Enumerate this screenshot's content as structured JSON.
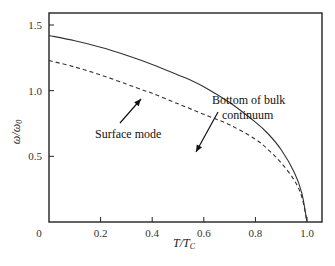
{
  "chart_data": {
    "type": "line",
    "title": "",
    "xlabel": "T/T_C",
    "xlabel_main": "T/T",
    "xlabel_sub": "C",
    "ylabel": "ω/ω_0",
    "ylabel_main": "ω/ω",
    "ylabel_sub": "0",
    "xlim": [
      0,
      1.06
    ],
    "ylim": [
      0,
      1.6
    ],
    "xticks": [
      0,
      0.2,
      0.4,
      0.6,
      0.8,
      1.0
    ],
    "xtick_labels": [
      "0",
      "0.2",
      "0.4",
      "0.6",
      "0.8",
      "1.0"
    ],
    "yticks": [
      0.5,
      1.0,
      1.5
    ],
    "ytick_labels": [
      "0.5",
      "1.0",
      "1.5"
    ],
    "grid": false,
    "legend": "none (inline annotations)",
    "series": [
      {
        "name": "Bottom of bulk continuum",
        "style": "solid",
        "x": [
          0,
          0.1,
          0.2,
          0.3,
          0.4,
          0.5,
          0.55,
          0.6,
          0.7,
          0.8,
          0.85,
          0.9,
          0.95,
          0.98,
          1.0
        ],
        "y": [
          1.42,
          1.38,
          1.33,
          1.27,
          1.2,
          1.12,
          1.08,
          1.03,
          0.91,
          0.76,
          0.67,
          0.55,
          0.38,
          0.22,
          0.0
        ]
      },
      {
        "name": "Surface mode",
        "style": "dashed",
        "x": [
          0,
          0.1,
          0.2,
          0.3,
          0.37,
          0.4,
          0.5,
          0.6,
          0.7,
          0.8,
          0.85,
          0.9,
          0.95,
          0.98,
          1.0
        ],
        "y": [
          1.23,
          1.18,
          1.12,
          1.05,
          1.0,
          0.98,
          0.9,
          0.82,
          0.74,
          0.63,
          0.55,
          0.45,
          0.32,
          0.19,
          0.0
        ]
      }
    ],
    "annotations": [
      {
        "text_line1": "Bottom of bulk",
        "text_line2": "continuum",
        "arrow_to": [
          0.55,
          1.08
        ]
      },
      {
        "text": "Surface mode",
        "arrow_to": [
          0.37,
          1.0
        ]
      }
    ]
  }
}
